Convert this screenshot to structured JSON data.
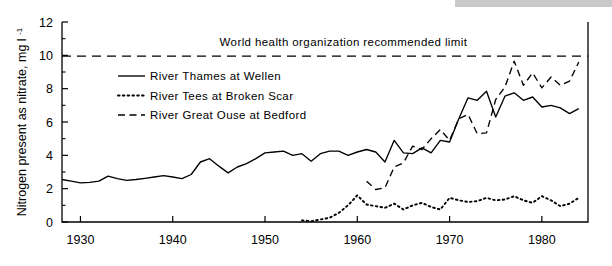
{
  "chart_data": {
    "type": "line",
    "title": "",
    "xlabel": "",
    "ylabel": "Nitrogen present as nitrate, mg l",
    "ylabel_superscript": "-1",
    "xlim": [
      1928,
      1985
    ],
    "ylim": [
      0,
      12
    ],
    "grid": false,
    "legend_position": "inside-upper-left",
    "xticks": [
      1930,
      1940,
      1950,
      1960,
      1970,
      1980
    ],
    "xtick_labels": [
      "1930",
      "1940",
      "1950",
      "1960",
      "1970",
      "1980"
    ],
    "yticks": [
      0,
      2,
      4,
      6,
      8,
      10,
      12
    ],
    "ytick_labels": [
      "0",
      "2",
      "4",
      "6",
      "8",
      "10",
      "12"
    ],
    "yminor_ticks": [
      1,
      3,
      5,
      7,
      9,
      11
    ],
    "annotations": [
      {
        "name": "who-limit-label",
        "text": "World health organization recommended limit",
        "x": 1958.5,
        "y": 10.55
      }
    ],
    "reference_lines": [
      {
        "name": "who-recommended-limit",
        "value": 9.95,
        "style": "dashed",
        "orientation": "horizontal"
      }
    ],
    "series": [
      {
        "name": "River Thames at Wellen",
        "style": "solid",
        "color": "#000000",
        "x": [
          1928,
          1929,
          1930,
          1931,
          1932,
          1933,
          1934,
          1935,
          1936,
          1937,
          1938,
          1939,
          1940,
          1941,
          1942,
          1943,
          1944,
          1945,
          1946,
          1947,
          1948,
          1949,
          1950,
          1951,
          1952,
          1953,
          1954,
          1955,
          1956,
          1957,
          1958,
          1959,
          1960,
          1961,
          1962,
          1963,
          1964,
          1965,
          1966,
          1967,
          1968,
          1969,
          1970,
          1971,
          1972,
          1973,
          1974,
          1975,
          1976,
          1977,
          1978,
          1979,
          1980,
          1981,
          1982,
          1983,
          1984
        ],
        "y": [
          2.55,
          2.45,
          2.35,
          2.38,
          2.45,
          2.75,
          2.6,
          2.5,
          2.55,
          2.62,
          2.7,
          2.78,
          2.7,
          2.6,
          2.85,
          3.6,
          3.8,
          3.35,
          2.95,
          3.3,
          3.5,
          3.8,
          4.15,
          4.2,
          4.25,
          4.0,
          4.1,
          3.65,
          4.1,
          4.25,
          4.25,
          4.0,
          4.2,
          4.35,
          4.2,
          3.6,
          4.9,
          4.15,
          4.1,
          4.45,
          4.15,
          4.9,
          4.8,
          6.2,
          7.45,
          7.3,
          7.85,
          6.3,
          7.55,
          7.75,
          7.3,
          7.5,
          6.9,
          7.0,
          6.85,
          6.5,
          6.8
        ]
      },
      {
        "name": "River Tees at Broken Scar",
        "style": "dotted",
        "color": "#000000",
        "x": [
          1954,
          1955,
          1956,
          1957,
          1958,
          1959,
          1960,
          1961,
          1962,
          1963,
          1964,
          1965,
          1966,
          1967,
          1968,
          1969,
          1970,
          1971,
          1972,
          1973,
          1974,
          1975,
          1976,
          1977,
          1978,
          1979,
          1980,
          1981,
          1982,
          1983,
          1984
        ],
        "y": [
          0.1,
          0.05,
          0.15,
          0.25,
          0.55,
          1.0,
          1.6,
          1.05,
          0.95,
          0.85,
          1.1,
          0.75,
          1.0,
          1.15,
          0.9,
          0.75,
          1.45,
          1.3,
          1.2,
          1.25,
          1.45,
          1.3,
          1.35,
          1.55,
          1.3,
          1.15,
          1.55,
          1.3,
          0.95,
          1.1,
          1.45
        ]
      },
      {
        "name": "River Great Ouse at Bedford",
        "style": "dashed",
        "color": "#000000",
        "x": [
          1961,
          1962,
          1963,
          1964,
          1965,
          1966,
          1967,
          1968,
          1969,
          1970,
          1971,
          1972,
          1973,
          1974,
          1975,
          1976,
          1977,
          1978,
          1979,
          1980,
          1981,
          1982,
          1983,
          1984
        ],
        "y": [
          2.45,
          1.95,
          2.05,
          3.3,
          3.55,
          4.55,
          4.35,
          5.0,
          5.55,
          4.9,
          6.2,
          6.45,
          5.3,
          5.35,
          7.35,
          8.1,
          9.65,
          8.2,
          8.95,
          8.05,
          8.7,
          8.2,
          8.45,
          9.6
        ]
      }
    ]
  },
  "legend": {
    "items": [
      {
        "label": "River Thames at Wellen",
        "style": "solid"
      },
      {
        "label": "River Tees at Broken Scar",
        "style": "dotted"
      },
      {
        "label": "River Great Ouse at Bedford",
        "style": "dashed"
      }
    ]
  }
}
